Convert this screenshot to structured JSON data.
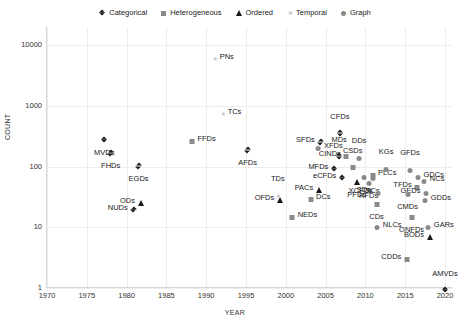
{
  "chart_data": {
    "type": "scatter",
    "title": "",
    "xlabel": "YEAR",
    "ylabel": "COUNT",
    "xlim": [
      1970,
      2021
    ],
    "ylim": [
      1,
      20000
    ],
    "yscale": "log",
    "grid": true,
    "legend_position": "top-center",
    "xticks": [
      "1970",
      "1975",
      "1980",
      "1985",
      "1990",
      "1995",
      "2000",
      "2005",
      "2010",
      "2015",
      "2020"
    ],
    "yticks": [
      "1",
      "10",
      "100",
      "1000",
      "10000"
    ],
    "legend": [
      {
        "label": "Categorical",
        "marker": "diamond"
      },
      {
        "label": "Heterogeneous",
        "marker": "square"
      },
      {
        "label": "Ordered",
        "marker": "triangle"
      },
      {
        "label": "Temporal",
        "marker": "temporal"
      },
      {
        "label": "Graph",
        "marker": "circle"
      }
    ],
    "points": [
      {
        "label": "PNs",
        "x": 1991.0,
        "y": 6500,
        "marker": "temporal",
        "lpos": "right"
      },
      {
        "label": "TCs",
        "x": 1992.0,
        "y": 800,
        "marker": "temporal",
        "lpos": "right"
      },
      {
        "label": "MVDs",
        "x": 1977.2,
        "y": 300,
        "marker": "diamond",
        "lpos": "below"
      },
      {
        "label": "FHDs",
        "x": 1978.0,
        "y": 180,
        "marker": "diamond",
        "lpos": "below"
      },
      {
        "label": "EGDs",
        "x": 1981.5,
        "y": 110,
        "marker": "diamond",
        "lpos": "below"
      },
      {
        "label": "ODs",
        "x": 1981.8,
        "y": 27,
        "marker": "triangle",
        "lpos": "left"
      },
      {
        "label": "NUDs",
        "x": 1980.9,
        "y": 21,
        "marker": "diamond",
        "lpos": "left"
      },
      {
        "label": "FFDs",
        "x": 1988.2,
        "y": 290,
        "marker": "square",
        "lpos": "right"
      },
      {
        "label": "AFDs",
        "x": 1995.2,
        "y": 200,
        "marker": "diamond",
        "lpos": "below"
      },
      {
        "label": "OFDs",
        "x": 1999.3,
        "y": 30,
        "marker": "triangle",
        "lpos": "left"
      },
      {
        "label": "TDs",
        "x": 1999.0,
        "y": 36,
        "marker": "temporal",
        "lpos": "above"
      },
      {
        "label": "NEDs",
        "x": 2000.8,
        "y": 16,
        "marker": "square",
        "lpos": "right"
      },
      {
        "label": "DCs",
        "x": 2003.1,
        "y": 31,
        "marker": "square",
        "lpos": "right"
      },
      {
        "label": "PACs",
        "x": 2004.2,
        "y": 45,
        "marker": "triangle",
        "lpos": "left"
      },
      {
        "label": "SFDs",
        "x": 2004.4,
        "y": 270,
        "marker": "diamond",
        "lpos": "left"
      },
      {
        "label": "XFDs",
        "x": 2004.1,
        "y": 220,
        "marker": "circle",
        "lpos": "right"
      },
      {
        "label": "MFDs",
        "x": 2006.1,
        "y": 100,
        "marker": "diamond",
        "lpos": "left"
      },
      {
        "label": "eCFDs",
        "x": 2007.1,
        "y": 70,
        "marker": "diamond",
        "lpos": "left"
      },
      {
        "label": "CFDs",
        "x": 2006.8,
        "y": 380,
        "marker": "diamond",
        "lpos": "above"
      },
      {
        "label": "MDs",
        "x": 2006.7,
        "y": 160,
        "marker": "diamond",
        "lpos": "above"
      },
      {
        "label": "CINDs",
        "x": 2007.6,
        "y": 160,
        "marker": "square",
        "lpos": "left"
      },
      {
        "label": "CSDs",
        "x": 2008.4,
        "y": 105,
        "marker": "square",
        "lpos": "above"
      },
      {
        "label": "DDs",
        "x": 2009.2,
        "y": 150,
        "marker": "circle",
        "lpos": "above"
      },
      {
        "label": "PFDs",
        "x": 2008.9,
        "y": 60,
        "marker": "triangle",
        "lpos": "below"
      },
      {
        "label": "SDs",
        "x": 2009.8,
        "y": 72,
        "marker": "circle",
        "lpos": "below"
      },
      {
        "label": "PLCs",
        "x": 2010.9,
        "y": 80,
        "marker": "square",
        "lpos": "right"
      },
      {
        "label": "SCs",
        "x": 2010.9,
        "y": 70,
        "marker": "circle",
        "lpos": "below"
      },
      {
        "label": "RFDs",
        "x": 2010.4,
        "y": 58,
        "marker": "circle",
        "lpos": "below"
      },
      {
        "label": "KGs",
        "x": 2012.6,
        "y": 100,
        "marker": "circle",
        "lpos": "above"
      },
      {
        "label": "XCFDs",
        "x": 2011.6,
        "y": 40,
        "marker": "circle",
        "lpos": "left"
      },
      {
        "label": "CDs",
        "x": 2011.4,
        "y": 26,
        "marker": "square",
        "lpos": "below"
      },
      {
        "label": "NLCs",
        "x": 2011.5,
        "y": 11,
        "marker": "circle",
        "lpos": "right"
      },
      {
        "label": "GFDs",
        "x": 2015.6,
        "y": 95,
        "marker": "circle",
        "lpos": "above"
      },
      {
        "label": "GDCs",
        "x": 2016.6,
        "y": 72,
        "marker": "circle",
        "lpos": "right"
      },
      {
        "label": "NCs",
        "x": 2017.4,
        "y": 62,
        "marker": "circle",
        "lpos": "right"
      },
      {
        "label": "TFDs",
        "x": 2016.5,
        "y": 50,
        "marker": "square",
        "lpos": "left"
      },
      {
        "label": "GEDs",
        "x": 2017.6,
        "y": 40,
        "marker": "right-na",
        "lpos": "left"
      },
      {
        "label": "CMDs",
        "x": 2015.3,
        "y": 38,
        "marker": "circle",
        "lpos": "below"
      },
      {
        "label": "GDDs",
        "x": 2017.5,
        "y": 30,
        "marker": "circle",
        "lpos": "right"
      },
      {
        "label": "ONFDs",
        "x": 2015.8,
        "y": 16,
        "marker": "square",
        "lpos": "below"
      },
      {
        "label": "GARs",
        "x": 2017.9,
        "y": 11,
        "marker": "circle",
        "lpos": "right"
      },
      {
        "label": "BODs",
        "x": 2018.1,
        "y": 7.5,
        "marker": "triangle",
        "lpos": "left"
      },
      {
        "label": "CDDs",
        "x": 2015.2,
        "y": 3.3,
        "marker": "square",
        "lpos": "left"
      },
      {
        "label": "AMVDs",
        "x": 2020.0,
        "y": 1.0,
        "marker": "diamond",
        "lpos": "above"
      }
    ]
  },
  "colors": {
    "categorical": "#1a1a1a",
    "heterogeneous": "#8a8a8a",
    "ordered": "#1a1a1a",
    "temporal": "#c9c9c9",
    "graph": "#8a8a8a",
    "grid": "#ededed",
    "axis": "#d6d6d6"
  }
}
